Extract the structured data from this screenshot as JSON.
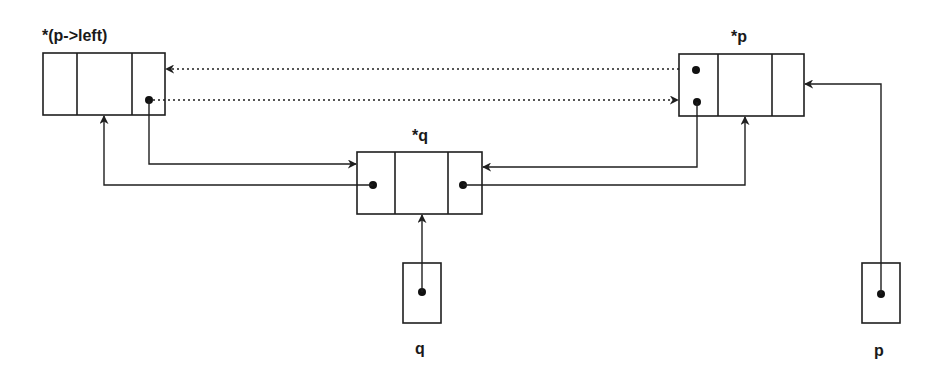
{
  "diagram": {
    "type": "doubly-linked-list-pointer-diagram",
    "nodes": [
      {
        "id": "left_node",
        "label": "*(p->left)",
        "fields": [
          "left",
          "data",
          "right"
        ]
      },
      {
        "id": "p_node",
        "label": "*p",
        "fields": [
          "left",
          "data",
          "right"
        ]
      },
      {
        "id": "q_node",
        "label": "*q",
        "fields": [
          "left",
          "data",
          "right"
        ]
      }
    ],
    "pointers": [
      {
        "id": "q_ptr",
        "label": "q",
        "points_to": "q_node"
      },
      {
        "id": "p_ptr",
        "label": "p",
        "points_to": "p_node"
      }
    ],
    "edges": [
      {
        "from": "left_node.right",
        "to": "q_node",
        "style": "solid"
      },
      {
        "from": "q_node.left",
        "to": "left_node",
        "style": "solid"
      },
      {
        "from": "q_node.right",
        "to": "p_node",
        "style": "solid"
      },
      {
        "from": "p_node.left",
        "to": "q_node",
        "style": "solid"
      },
      {
        "from": "left_node.right",
        "to": "p_node",
        "style": "dotted",
        "note": "old link"
      },
      {
        "from": "p_node.left",
        "to": "left_node",
        "style": "dotted",
        "note": "old link"
      },
      {
        "from": "q_ptr",
        "to": "q_node",
        "style": "solid"
      },
      {
        "from": "p_ptr",
        "to": "p_node",
        "style": "solid"
      }
    ]
  },
  "labels": {
    "left_node": "*(p->left)",
    "p_node": "*p",
    "q_node": "*q",
    "q_ptr": "q",
    "p_ptr": "p"
  },
  "colors": {
    "stroke": "#1f1f1f",
    "background": "#ffffff"
  }
}
